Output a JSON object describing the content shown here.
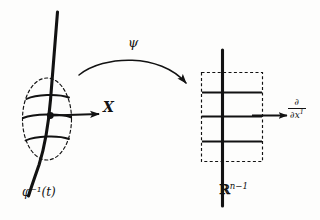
{
  "figure": {
    "domain": "differential-geometry-diagram",
    "background_color": "#fdfdfc",
    "ink_color": "#121212",
    "labels": {
      "map_arrow": "ψ",
      "vector_field_left": "X",
      "curve_left": "φ⁻¹(t)",
      "target_space": "ℝ",
      "target_space_exponent": "n−1",
      "vector_field_right_numerator": "∂",
      "vector_field_right_denominator": "∂x",
      "vector_field_right_index": "1"
    },
    "left_panel": {
      "name": "manifold-neighbourhood",
      "boundary_style": "dashed-ellipse",
      "curve": "thick-vertical-curve",
      "grid_lines": 3,
      "marked_point": true,
      "arrow_direction": "right"
    },
    "right_panel": {
      "name": "coordinate-chart-image",
      "boundary_style": "dashed-rectangle",
      "axis": "thick-vertical-line",
      "grid_lines": 3,
      "arrow_direction": "right"
    },
    "connector": {
      "name": "psi-map-arc",
      "style": "curved-arrow",
      "from": "left-panel",
      "to": "right-panel"
    }
  }
}
